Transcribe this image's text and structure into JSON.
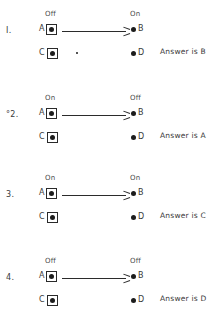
{
  "diagram": {
    "ink_color": "#2a2a2a",
    "items": [
      {
        "number": "I.",
        "state_left": "Off",
        "state_right": "On",
        "nodes": {
          "a": "A",
          "b": "B",
          "c": "C",
          "d": "D"
        },
        "answer": "Answer is B",
        "has_speck": true
      },
      {
        "number": "°2.",
        "state_left": "On",
        "state_right": "Off",
        "nodes": {
          "a": "A",
          "b": "B",
          "c": "C",
          "d": "D"
        },
        "answer": "Answer is A",
        "has_speck": false
      },
      {
        "number": "3.",
        "state_left": "On",
        "state_right": "On",
        "nodes": {
          "a": "A",
          "b": "B",
          "c": "C",
          "d": "D"
        },
        "answer": "Answer is C",
        "has_speck": false
      },
      {
        "number": "4.",
        "state_left": "Off",
        "state_right": "Off",
        "nodes": {
          "a": "A",
          "b": "B",
          "c": "C",
          "d": "D"
        },
        "answer": "Answer is D",
        "has_speck": false
      }
    ]
  }
}
